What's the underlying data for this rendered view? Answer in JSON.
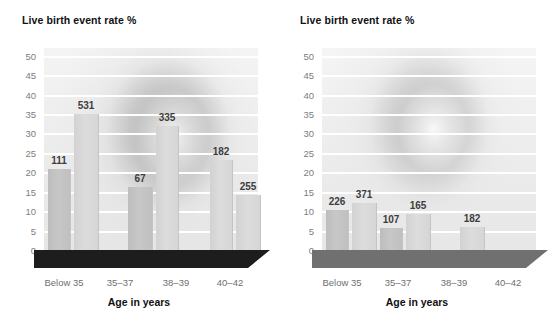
{
  "figure": {
    "background_color": "#ffffff",
    "bar_color": "#d6d6d6",
    "bar_color_dark": "#c2c2c2",
    "gridline_color": "#ffffff",
    "floor_color_left": "#1c1c1c",
    "floor_color_right": "#6e6e6e",
    "label_color": "#3d3d3d",
    "tick_color": "#7d7d7d"
  },
  "charts": [
    {
      "id": "chart-left",
      "chart_data": {
        "type": "bar",
        "title": "Live birth event rate %",
        "xlabel": "Age in years",
        "ylabel": "Live birth event rate %",
        "ylim": [
          0,
          52
        ],
        "yticks": [
          50,
          45,
          40,
          35,
          30,
          25,
          20,
          15,
          10,
          5,
          0
        ],
        "grid": true,
        "legend": "none",
        "categories": [
          "Below 35",
          "35–37",
          "38–39",
          "40–42"
        ],
        "series": [
          {
            "name": "group-a",
            "values": [
              20.8,
              16.2,
              23.1,
              14.2
            ]
          },
          {
            "name": "group-b",
            "values": [
              34.9,
              32.0,
              0,
              0
            ]
          }
        ],
        "bars": [
          {
            "category": "Below 35",
            "value": 20.8,
            "label": "111",
            "shade": "dark"
          },
          {
            "category": "Below 35",
            "value": 34.9,
            "label": "531",
            "shade": "light"
          },
          {
            "category": "35–37",
            "value": 16.2,
            "label": "67",
            "shade": "dark"
          },
          {
            "category": "35–37",
            "value": 32.0,
            "label": "335",
            "shade": "light"
          },
          {
            "category": "38–39",
            "value": 23.1,
            "label": "182",
            "shade": "light"
          },
          {
            "category": "40–42",
            "value": 14.2,
            "label": "255",
            "shade": "light"
          }
        ],
        "annotations": [
          "111",
          "531",
          "67",
          "335",
          "182",
          "255"
        ]
      }
    },
    {
      "id": "chart-right",
      "chart_data": {
        "type": "bar",
        "title": "Live birth event rate %",
        "xlabel": "Age in years",
        "ylabel": "Live birth event rate %",
        "ylim": [
          0,
          52
        ],
        "yticks": [
          50,
          45,
          40,
          35,
          30,
          25,
          20,
          15,
          10,
          5,
          0
        ],
        "grid": true,
        "legend": "none",
        "categories": [
          "Below 35",
          "35–37",
          "38–39",
          "40–42"
        ],
        "bars": [
          {
            "category": "Below 35",
            "value": 10.4,
            "label": "226",
            "shade": "dark"
          },
          {
            "category": "Below 35",
            "value": 12.0,
            "label": "371",
            "shade": "light"
          },
          {
            "category": "35–37",
            "value": 5.6,
            "label": "107",
            "shade": "dark"
          },
          {
            "category": "35–37",
            "value": 9.3,
            "label": "165",
            "shade": "light"
          },
          {
            "category": "38–39",
            "value": 5.8,
            "label": "182",
            "shade": "light"
          },
          {
            "category": "40–42",
            "value": 0,
            "label": "",
            "shade": "light"
          }
        ],
        "annotations": [
          "226",
          "371",
          "107",
          "165",
          "182"
        ]
      }
    }
  ]
}
